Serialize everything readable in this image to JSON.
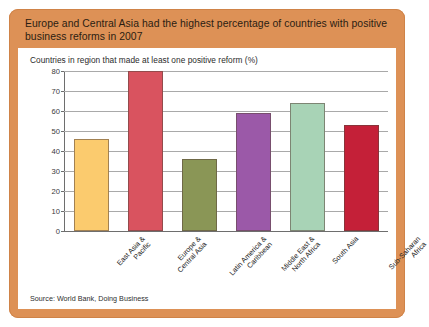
{
  "headline": "Europe and Central Asia had the highest percentage of countries with positive business reforms in 2007",
  "source_note": "Source: World Bank, Doing Business",
  "colors": {
    "panel": "#DD9156",
    "card": "#FFFFFF",
    "gridline": "#A9A9A9",
    "axis": "#6E6E6E"
  },
  "chart_data": {
    "type": "bar",
    "title": "Europe and Central Asia had the highest percentage of countries with positive business reforms in 2007",
    "subtitle": "Countries in region that made at least one positive reform (%)",
    "xlabel": "",
    "ylabel": "",
    "ylim": [
      0,
      80
    ],
    "yticks": [
      0,
      10,
      20,
      30,
      40,
      50,
      60,
      70,
      80
    ],
    "grid": true,
    "legend": false,
    "categories": [
      "East Asia &\nPacific",
      "Europe &\nCentral Asia",
      "Latin America &\nCaribbean",
      "Middle East &\nNorth Africa",
      "South Asia",
      "Sub-Saharan\nAfrica"
    ],
    "values": [
      46,
      80,
      36,
      59,
      64,
      53
    ],
    "bar_colors": [
      "#FBCB6E",
      "#D9535F",
      "#8A9656",
      "#9B59A8",
      "#A8D3B6",
      "#C42038"
    ],
    "source": "World Bank, Doing Business"
  }
}
